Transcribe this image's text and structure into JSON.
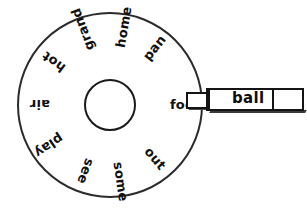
{
  "wheel": {
    "name": "word-wheel",
    "center_label": "",
    "words": [
      {
        "text": "foot",
        "angle_deg": 0,
        "rotation_deg": 0,
        "radius": 60
      },
      {
        "text": "pan",
        "angle_deg": -52,
        "rotation_deg": -52,
        "radius": 58
      },
      {
        "text": "home",
        "angle_deg": -80,
        "rotation_deg": -80,
        "radius": 58
      },
      {
        "text": "grand",
        "angle_deg": -110,
        "rotation_deg": -110,
        "radius": 58
      },
      {
        "text": "hot",
        "angle_deg": -143,
        "rotation_deg": -143,
        "radius": 58
      },
      {
        "text": "air",
        "angle_deg": 180,
        "rotation_deg": 180,
        "radius": 60
      },
      {
        "text": "play",
        "angle_deg": 146,
        "rotation_deg": 146,
        "radius": 58
      },
      {
        "text": "see",
        "angle_deg": 110,
        "rotation_deg": 110,
        "radius": 58
      },
      {
        "text": "some",
        "angle_deg": 82,
        "rotation_deg": 82,
        "radius": 58
      },
      {
        "text": "out",
        "angle_deg": 50,
        "rotation_deg": 50,
        "radius": 58
      }
    ]
  },
  "card": {
    "name": "sliding-card",
    "word": "ball"
  },
  "colors": {
    "ink": "#101010",
    "paper": "#ffffff"
  }
}
